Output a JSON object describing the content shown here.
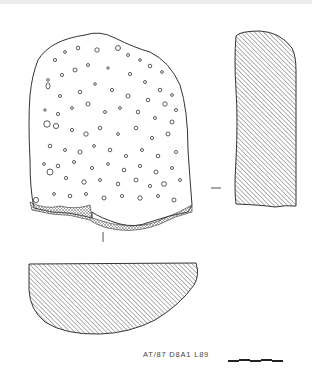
{
  "figure": {
    "type": "archaeological artefact illustration",
    "views": [
      "face-view",
      "side-profile-section",
      "cross-section"
    ],
    "label": "AT/87 D8A1 L89",
    "scale_bar": {
      "segments": 5,
      "pattern": "alternating"
    },
    "colors": {
      "ink": "#333333",
      "hatch": "#555555",
      "background": "#ffffff"
    }
  }
}
